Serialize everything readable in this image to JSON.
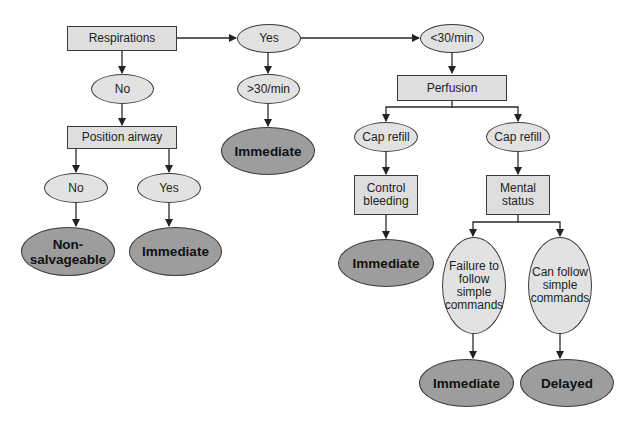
{
  "diagram": {
    "type": "flowchart",
    "colors": {
      "decision_box": "#dedede",
      "condition_oval": "#e2e2e2",
      "outcome_oval": "#9d9d9d",
      "stroke": "#3a3a3a"
    },
    "nodes": {
      "respirations": "Respirations",
      "resp_no": "No",
      "position_airway": "Position airway",
      "airway_no": "No",
      "airway_yes": "Yes",
      "non_salvageable": "Non-salvageable",
      "airway_immediate": "Immediate",
      "resp_yes": "Yes",
      "over30": ">30/min",
      "over30_immediate": "Immediate",
      "under30": "<30/min",
      "perfusion": "Perfusion",
      "cap_refill_left": "Cap refill",
      "control_bleeding": "Control bleeding",
      "bleeding_immediate": "Immediate",
      "cap_refill_right": "Cap refill",
      "mental_status": "Mental status",
      "failure_follow": "Failure to follow simple commands",
      "can_follow": "Can follow simple commands",
      "mental_immediate": "Immediate",
      "delayed": "Delayed"
    },
    "edges": [
      [
        "respirations",
        "resp_no"
      ],
      [
        "respirations",
        "resp_yes"
      ],
      [
        "resp_no",
        "position_airway"
      ],
      [
        "position_airway",
        "airway_no"
      ],
      [
        "position_airway",
        "airway_yes"
      ],
      [
        "airway_no",
        "non_salvageable"
      ],
      [
        "airway_yes",
        "airway_immediate"
      ],
      [
        "resp_yes",
        "over30"
      ],
      [
        "resp_yes",
        "under30"
      ],
      [
        "over30",
        "over30_immediate"
      ],
      [
        "under30",
        "perfusion"
      ],
      [
        "perfusion",
        "cap_refill_left"
      ],
      [
        "perfusion",
        "cap_refill_right"
      ],
      [
        "cap_refill_left",
        "control_bleeding"
      ],
      [
        "control_bleeding",
        "bleeding_immediate"
      ],
      [
        "cap_refill_right",
        "mental_status"
      ],
      [
        "mental_status",
        "failure_follow"
      ],
      [
        "mental_status",
        "can_follow"
      ],
      [
        "failure_follow",
        "mental_immediate"
      ],
      [
        "can_follow",
        "delayed"
      ]
    ]
  }
}
